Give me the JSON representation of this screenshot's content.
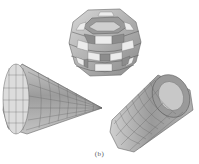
{
  "figure": {
    "caption": "(b)",
    "objects": [
      {
        "name": "sphere",
        "shape": "faceted-sphere",
        "pattern": "checkerboard"
      },
      {
        "name": "cone",
        "shape": "faceted-cone",
        "pattern": "gridded"
      },
      {
        "name": "cylinder",
        "shape": "faceted-cylinder",
        "pattern": "gridded"
      }
    ]
  },
  "colors": {
    "light": "#e6e6e6",
    "mid": "#b4b4b4",
    "dark": "#7a7a7a",
    "edge": "#5a5a5a",
    "background": "#ffffff"
  }
}
